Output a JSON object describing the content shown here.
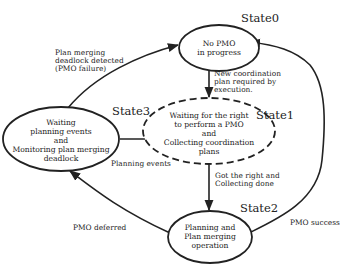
{
  "diagram": {
    "type": "state-transition",
    "colors": {
      "stroke": "#222222",
      "background": "#ffffff",
      "text": "#222222"
    },
    "states": [
      {
        "id": "state0",
        "label": "State0",
        "lines": [
          "No PMO",
          "in progress"
        ],
        "style": "solid"
      },
      {
        "id": "state1",
        "label": "State1",
        "lines": [
          "Waiting for the right",
          "to perform a PMO",
          "and",
          "Collecting coordination",
          "plans"
        ],
        "style": "dashed"
      },
      {
        "id": "state2",
        "label": "State2",
        "lines": [
          "Planning and",
          "Plan merging",
          "operation"
        ],
        "style": "solid"
      },
      {
        "id": "state3",
        "label": "State3",
        "lines": [
          "Waiting",
          "planning events",
          "and",
          "Monitoring plan merging",
          "deadlock"
        ],
        "style": "solid"
      }
    ],
    "transitions": [
      {
        "from": "state0",
        "to": "state1",
        "lines": [
          "New coordination",
          "plan required by",
          "execution."
        ]
      },
      {
        "from": "state1",
        "to": "state2",
        "lines": [
          "Got the right and",
          "Collecting done"
        ]
      },
      {
        "from": "state2",
        "to": "state0",
        "lines": [
          "PMO success"
        ]
      },
      {
        "from": "state2",
        "to": "state3",
        "lines": [
          "PMO deferred"
        ]
      },
      {
        "from": "state3",
        "to": "state1",
        "lines": [
          "Planning events"
        ]
      },
      {
        "from": "state3",
        "to": "state0",
        "lines": [
          "Plan merging",
          "deadlock detected",
          "(PMO failure)"
        ]
      }
    ]
  }
}
